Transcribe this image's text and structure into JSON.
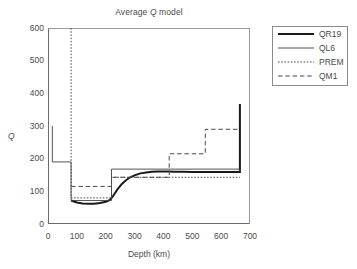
{
  "chart_data": {
    "type": "line",
    "title": "Average Q model",
    "title_parts": {
      "pre": "Average ",
      "italic": "Q",
      "post": " model"
    },
    "xlabel": "Depth (km)",
    "ylabel": "Q",
    "xlim": [
      0,
      700
    ],
    "ylim": [
      0,
      600
    ],
    "xticks": [
      0,
      100,
      200,
      300,
      400,
      500,
      600,
      700
    ],
    "yticks": [
      0,
      100,
      200,
      300,
      400,
      500,
      600
    ],
    "x_minor_tick_step": 20,
    "y_minor_tick_step": 25,
    "grid": false,
    "legend_position": "outside-right-top",
    "series": [
      {
        "name": "QR19",
        "style": "solid-thick",
        "color": "#1a1a1a",
        "points": [
          [
            80,
            72
          ],
          [
            100,
            66
          ],
          [
            120,
            63
          ],
          [
            140,
            62
          ],
          [
            160,
            62
          ],
          [
            180,
            64
          ],
          [
            200,
            68
          ],
          [
            215,
            74
          ],
          [
            225,
            85
          ],
          [
            240,
            105
          ],
          [
            255,
            122
          ],
          [
            270,
            134
          ],
          [
            285,
            143
          ],
          [
            300,
            149
          ],
          [
            320,
            155
          ],
          [
            340,
            158
          ],
          [
            360,
            160
          ],
          [
            380,
            161
          ],
          [
            400,
            161
          ],
          [
            420,
            161
          ],
          [
            440,
            160
          ],
          [
            470,
            160
          ],
          [
            500,
            159
          ],
          [
            540,
            159
          ],
          [
            580,
            159
          ],
          [
            620,
            159
          ],
          [
            660,
            159
          ],
          [
            665,
            159
          ],
          [
            665,
            367
          ]
        ]
      },
      {
        "name": "QL6",
        "style": "solid-thin",
        "color": "#404040",
        "points": [
          [
            15,
            300
          ],
          [
            15,
            190
          ],
          [
            80,
            190
          ],
          [
            80,
            72
          ],
          [
            220,
            72
          ],
          [
            220,
            168
          ],
          [
            665,
            168
          ],
          [
            665,
            160
          ]
        ]
      },
      {
        "name": "PREM",
        "style": "dotted",
        "color": "#4a4a4a",
        "points": [
          [
            80,
            600
          ],
          [
            80,
            80
          ],
          [
            220,
            80
          ],
          [
            220,
            143
          ],
          [
            665,
            143
          ]
        ]
      },
      {
        "name": "QM1",
        "style": "dashed",
        "color": "#4a4a4a",
        "points": [
          [
            80,
            115
          ],
          [
            220,
            115
          ],
          [
            220,
            143
          ],
          [
            420,
            143
          ],
          [
            420,
            215
          ],
          [
            545,
            215
          ],
          [
            545,
            290
          ],
          [
            665,
            290
          ]
        ]
      }
    ]
  },
  "legend": {
    "items": [
      {
        "label": "QR19",
        "style": "solid-thick"
      },
      {
        "label": "QL6",
        "style": "solid-thin"
      },
      {
        "label": "PREM",
        "style": "dotted"
      },
      {
        "label": "QM1",
        "style": "dashed"
      }
    ]
  }
}
